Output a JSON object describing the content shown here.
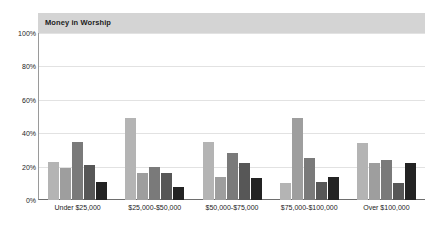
{
  "chart_data": {
    "type": "bar",
    "title": "Money in Worship",
    "xlabel": "",
    "ylabel": "",
    "ylim": [
      0,
      100
    ],
    "grid": true,
    "legend": "none",
    "categories": [
      "Under $25,000",
      "$25,000-$50,000",
      "$50,000-$75,000",
      "$75,000-$100,000",
      "Over $100,000"
    ],
    "ytick_labels": [
      "100%",
      "80%",
      "60%",
      "40%",
      "20%",
      "0%"
    ],
    "ytick_values": [
      100,
      80,
      60,
      40,
      20,
      0
    ],
    "series": [
      {
        "name": "Series 1",
        "color": "#b4b4b4",
        "values": [
          23,
          49,
          35,
          10,
          34
        ]
      },
      {
        "name": "Series 2",
        "color": "#9e9e9e",
        "values": [
          19,
          16,
          14,
          49,
          22
        ]
      },
      {
        "name": "Series 3",
        "color": "#7a7a7a",
        "values": [
          35,
          20,
          28,
          25,
          24
        ]
      },
      {
        "name": "Series 4",
        "color": "#575757",
        "values": [
          21,
          16,
          22,
          11,
          10
        ]
      },
      {
        "name": "Series 5",
        "color": "#232323",
        "values": [
          11,
          8,
          13,
          14,
          22
        ]
      }
    ]
  }
}
